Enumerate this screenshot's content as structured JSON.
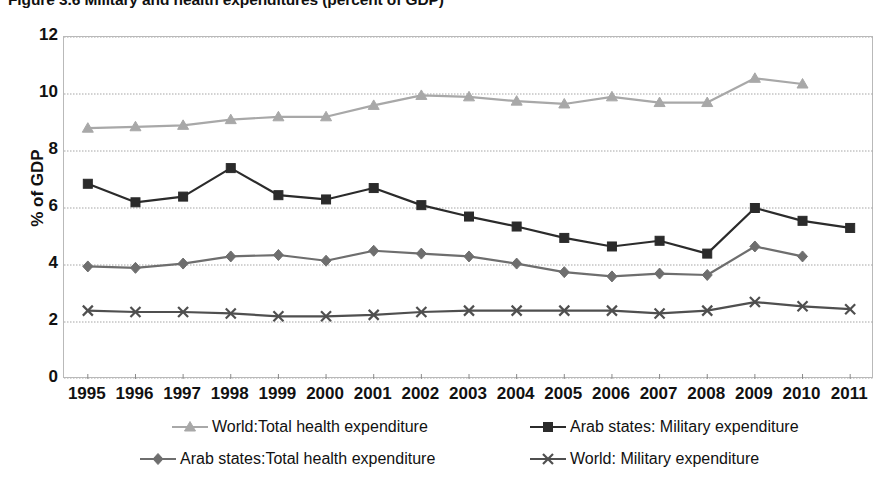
{
  "figure": {
    "title": "Figure 3.6 Military and health expenditures (percent of GDP)"
  },
  "axes": {
    "y_title": "% of GDP",
    "y_ticks": [
      "0",
      "2",
      "4",
      "6",
      "8",
      "10",
      "12"
    ],
    "x_ticks": [
      "1995",
      "1996",
      "1997",
      "1998",
      "1999",
      "2000",
      "2001",
      "2002",
      "2003",
      "2004",
      "2005",
      "2006",
      "2007",
      "2008",
      "2009",
      "2010",
      "2011"
    ]
  },
  "legend": {
    "items": [
      {
        "label": "World:Total health expenditure",
        "marker": "triangle-marker",
        "color": "#a8a8a8"
      },
      {
        "label": "Arab states: Military expenditure",
        "marker": "square-marker",
        "color": "#2b2b2b"
      },
      {
        "label": "Arab states:Total health expenditure",
        "marker": "diamond-marker",
        "color": "#6e6e6e"
      },
      {
        "label": "World: Military expenditure",
        "marker": "x-marker",
        "color": "#4f4f4f"
      }
    ]
  },
  "chart_data": {
    "type": "line",
    "title": "Figure 3.6 Military and health expenditures (percent of GDP)",
    "xlabel": "",
    "ylabel": "% of GDP",
    "ylim": [
      0,
      12
    ],
    "ytick_step": 2,
    "grid": true,
    "legend_position": "bottom",
    "x": [
      1995,
      1996,
      1997,
      1998,
      1999,
      2000,
      2001,
      2002,
      2003,
      2004,
      2005,
      2006,
      2007,
      2008,
      2009,
      2010,
      2011
    ],
    "series": [
      {
        "name": "World:Total health expenditure",
        "color": "#a8a8a8",
        "marker": "triangle",
        "x": [
          1995,
          1996,
          1997,
          1998,
          1999,
          2000,
          2001,
          2002,
          2003,
          2004,
          2005,
          2006,
          2007,
          2008,
          2009,
          2010
        ],
        "values": [
          8.8,
          8.85,
          8.9,
          9.1,
          9.2,
          9.2,
          9.6,
          9.95,
          9.9,
          9.75,
          9.65,
          9.9,
          9.7,
          9.7,
          10.55,
          10.35
        ]
      },
      {
        "name": "Arab states: Military expenditure",
        "color": "#2b2b2b",
        "marker": "square",
        "x": [
          1995,
          1996,
          1997,
          1998,
          1999,
          2000,
          2001,
          2002,
          2003,
          2004,
          2005,
          2006,
          2007,
          2008,
          2009,
          2010,
          2011
        ],
        "values": [
          6.85,
          6.2,
          6.4,
          7.4,
          6.45,
          6.3,
          6.7,
          6.1,
          5.7,
          5.35,
          4.95,
          4.65,
          4.85,
          4.4,
          6.0,
          5.55,
          5.3
        ]
      },
      {
        "name": "Arab states:Total health expenditure",
        "color": "#6e6e6e",
        "marker": "diamond",
        "x": [
          1995,
          1996,
          1997,
          1998,
          1999,
          2000,
          2001,
          2002,
          2003,
          2004,
          2005,
          2006,
          2007,
          2008,
          2009,
          2010
        ],
        "values": [
          3.95,
          3.9,
          4.05,
          4.3,
          4.35,
          4.15,
          4.5,
          4.4,
          4.3,
          4.05,
          3.75,
          3.6,
          3.7,
          3.65,
          4.65,
          4.3
        ]
      },
      {
        "name": "World: Military expenditure",
        "color": "#4f4f4f",
        "marker": "x",
        "x": [
          1995,
          1996,
          1997,
          1998,
          1999,
          2000,
          2001,
          2002,
          2003,
          2004,
          2005,
          2006,
          2007,
          2008,
          2009,
          2010,
          2011
        ],
        "values": [
          2.4,
          2.35,
          2.35,
          2.3,
          2.2,
          2.2,
          2.25,
          2.35,
          2.4,
          2.4,
          2.4,
          2.4,
          2.3,
          2.4,
          2.7,
          2.55,
          2.45
        ]
      }
    ]
  }
}
